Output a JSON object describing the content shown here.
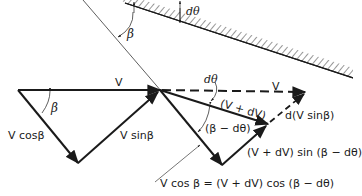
{
  "diagram": {
    "colors": {
      "ink": "#1a1a1a",
      "background": "#ffffff"
    },
    "labels": {
      "beta_wall": "β",
      "dtheta_wall": "dθ",
      "v_left": "V",
      "beta_left": "β",
      "v_cos_beta": "V cosβ",
      "v_sin_beta": "V sinβ",
      "dtheta_mid": "dθ",
      "v_dashed": "V",
      "v_plus_dv": "(V + dV)",
      "beta_minus_dtheta": "(β − dθ)",
      "d_v_sin_beta": "d(V sinβ)",
      "v_plus_dv_sin": "(V + dV) sin (β − dθ)",
      "equation": "V cos β = (V + dV) cos (β − dθ)"
    }
  }
}
